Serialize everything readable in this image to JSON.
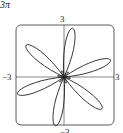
{
  "header": {
    "fragment": "3π"
  },
  "axes": {
    "top": "3",
    "left": "−3",
    "right": "3",
    "bottom": "−3"
  },
  "chart_data": {
    "type": "line",
    "xlim": [
      -3,
      3
    ],
    "ylim": [
      -3,
      3
    ],
    "tick_labels": {
      "x": [
        "−3",
        "3"
      ],
      "y": [
        "3",
        "−3"
      ]
    },
    "grid": false,
    "petals": 6,
    "petal_directions_deg": [
      20,
      80,
      140,
      200,
      260,
      320
    ],
    "max_radius": 3
  }
}
